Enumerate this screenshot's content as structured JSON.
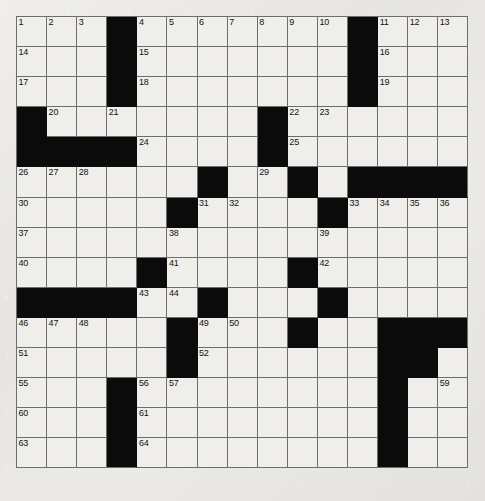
{
  "puzzle": {
    "title": "Crossword Puzzle Grid",
    "rows": 15,
    "columns": 15,
    "cell_size_px": 30.1,
    "colors": {
      "background": "#e8e7e4",
      "cell_fill": "#efeeeb",
      "block_fill": "#0b0b0b",
      "grid_line": "#6d6d6d",
      "number_text": "#111111"
    },
    "legend": {
      "block_symbol": "#",
      "open_symbol": "."
    },
    "layout": [
      "...#.......#...",
      "...#.......#...",
      "...#.......#...",
      "#.......#......",
      "####....#......",
      "......#..#.####",
      ".....#....#....",
      "...............",
      "....#....#.....",
      "####..#...#....",
      ".....#...#..###",
      ".....#......##.",
      "...#........#..",
      "...#........#..",
      "...#........#.."
    ],
    "numbers": [
      {
        "n": 1,
        "row": 1,
        "col": 1
      },
      {
        "n": 2,
        "row": 1,
        "col": 2
      },
      {
        "n": 3,
        "row": 1,
        "col": 3
      },
      {
        "n": 4,
        "row": 1,
        "col": 5
      },
      {
        "n": 5,
        "row": 1,
        "col": 6
      },
      {
        "n": 6,
        "row": 1,
        "col": 7
      },
      {
        "n": 7,
        "row": 1,
        "col": 8
      },
      {
        "n": 8,
        "row": 1,
        "col": 9
      },
      {
        "n": 9,
        "row": 1,
        "col": 10
      },
      {
        "n": 10,
        "row": 1,
        "col": 11
      },
      {
        "n": 11,
        "row": 1,
        "col": 13
      },
      {
        "n": 12,
        "row": 1,
        "col": 14
      },
      {
        "n": 13,
        "row": 1,
        "col": 15
      },
      {
        "n": 14,
        "row": 2,
        "col": 1
      },
      {
        "n": 15,
        "row": 2,
        "col": 5
      },
      {
        "n": 16,
        "row": 2,
        "col": 13
      },
      {
        "n": 17,
        "row": 3,
        "col": 1
      },
      {
        "n": 18,
        "row": 3,
        "col": 5
      },
      {
        "n": 19,
        "row": 3,
        "col": 13
      },
      {
        "n": 20,
        "row": 4,
        "col": 2
      },
      {
        "n": 21,
        "row": 4,
        "col": 4
      },
      {
        "n": 22,
        "row": 4,
        "col": 10
      },
      {
        "n": 23,
        "row": 4,
        "col": 11
      },
      {
        "n": 24,
        "row": 5,
        "col": 5
      },
      {
        "n": 25,
        "row": 5,
        "col": 10
      },
      {
        "n": 26,
        "row": 6,
        "col": 1
      },
      {
        "n": 27,
        "row": 6,
        "col": 2
      },
      {
        "n": 28,
        "row": 6,
        "col": 3
      },
      {
        "n": 29,
        "row": 6,
        "col": 9
      },
      {
        "n": 30,
        "row": 7,
        "col": 1
      },
      {
        "n": 31,
        "row": 7,
        "col": 7
      },
      {
        "n": 32,
        "row": 7,
        "col": 8
      },
      {
        "n": 33,
        "row": 7,
        "col": 12
      },
      {
        "n": 34,
        "row": 7,
        "col": 13
      },
      {
        "n": 35,
        "row": 7,
        "col": 14
      },
      {
        "n": 36,
        "row": 7,
        "col": 15
      },
      {
        "n": 37,
        "row": 8,
        "col": 1
      },
      {
        "n": 38,
        "row": 8,
        "col": 6
      },
      {
        "n": 39,
        "row": 8,
        "col": 11
      },
      {
        "n": 40,
        "row": 9,
        "col": 1
      },
      {
        "n": 41,
        "row": 9,
        "col": 6
      },
      {
        "n": 42,
        "row": 9,
        "col": 11
      },
      {
        "n": 43,
        "row": 10,
        "col": 5
      },
      {
        "n": 44,
        "row": 10,
        "col": 6
      },
      {
        "n": 45,
        "row": 10,
        "col": 11
      },
      {
        "n": 46,
        "row": 11,
        "col": 1
      },
      {
        "n": 47,
        "row": 11,
        "col": 2
      },
      {
        "n": 48,
        "row": 11,
        "col": 3
      },
      {
        "n": 49,
        "row": 11,
        "col": 7
      },
      {
        "n": 50,
        "row": 11,
        "col": 8
      },
      {
        "n": 51,
        "row": 12,
        "col": 1
      },
      {
        "n": 52,
        "row": 12,
        "col": 7
      },
      {
        "n": 53,
        "row": 12,
        "col": 13
      },
      {
        "n": 54,
        "row": 12,
        "col": 14
      },
      {
        "n": 55,
        "row": 13,
        "col": 1
      },
      {
        "n": 56,
        "row": 13,
        "col": 5
      },
      {
        "n": 57,
        "row": 13,
        "col": 6
      },
      {
        "n": 58,
        "row": 13,
        "col": 13
      },
      {
        "n": 59,
        "row": 13,
        "col": 15
      },
      {
        "n": 60,
        "row": 14,
        "col": 1
      },
      {
        "n": 61,
        "row": 14,
        "col": 5
      },
      {
        "n": 62,
        "row": 14,
        "col": 13
      },
      {
        "n": 63,
        "row": 15,
        "col": 1
      },
      {
        "n": 64,
        "row": 15,
        "col": 5
      },
      {
        "n": 65,
        "row": 15,
        "col": 13
      }
    ]
  }
}
